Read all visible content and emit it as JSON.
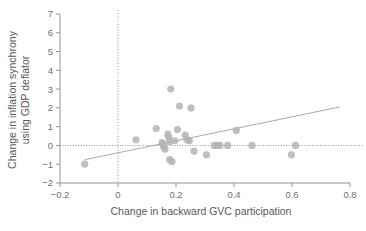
{
  "chart_data": {
    "type": "scatter",
    "title": "",
    "xlabel": "Change in backward GVC participation",
    "ylabel": "Change in inflation synchrony using GDP deflator",
    "ylabel_line1": "Change in inflation synchrony",
    "ylabel_line2": "using GDP deflator",
    "xlim": [
      -0.2,
      0.8
    ],
    "ylim": [
      -2,
      7
    ],
    "xticks": [
      -0.2,
      0,
      0.2,
      0.4,
      0.6,
      0.8
    ],
    "xticklabels": [
      "−0.2",
      "0",
      "0.2",
      "0.4",
      "0.6",
      "0.8"
    ],
    "yticks": [
      -2,
      -1,
      0,
      1,
      2,
      3,
      4,
      5,
      6,
      7
    ],
    "yticklabels": [
      "−2",
      "−1",
      "0",
      "1",
      "2",
      "3",
      "4",
      "5",
      "6",
      "7"
    ],
    "grid": false,
    "legend": "none",
    "reference_lines": [
      {
        "name": "y-zero",
        "orientation": "horizontal",
        "value": 0,
        "style": "dotted"
      },
      {
        "name": "x-zero",
        "orientation": "vertical",
        "value": 0,
        "style": "dotted"
      }
    ],
    "trendline": {
      "name": "linear-fit",
      "x_start": -0.115,
      "y_start": -0.76,
      "x_end": 0.765,
      "y_end": 2.05
    },
    "marker": {
      "shape": "circle",
      "color": "#b2b4b6",
      "radius_px": 3.6
    },
    "points": [
      {
        "x": -0.115,
        "y": -1.0
      },
      {
        "x": 0.062,
        "y": 0.3
      },
      {
        "x": 0.132,
        "y": 0.9
      },
      {
        "x": 0.152,
        "y": 0.15
      },
      {
        "x": 0.155,
        "y": 0.05
      },
      {
        "x": 0.158,
        "y": -0.1
      },
      {
        "x": 0.162,
        "y": -0.2
      },
      {
        "x": 0.172,
        "y": 0.6
      },
      {
        "x": 0.175,
        "y": 0.45
      },
      {
        "x": 0.178,
        "y": 0.2
      },
      {
        "x": 0.182,
        "y": 3.0
      },
      {
        "x": 0.178,
        "y": -0.75
      },
      {
        "x": 0.186,
        "y": -0.85
      },
      {
        "x": 0.196,
        "y": 0.25
      },
      {
        "x": 0.205,
        "y": 0.85
      },
      {
        "x": 0.212,
        "y": 2.1
      },
      {
        "x": 0.232,
        "y": 0.55
      },
      {
        "x": 0.238,
        "y": 0.3
      },
      {
        "x": 0.246,
        "y": 0.25
      },
      {
        "x": 0.252,
        "y": 2.0
      },
      {
        "x": 0.262,
        "y": -0.3
      },
      {
        "x": 0.305,
        "y": -0.5
      },
      {
        "x": 0.332,
        "y": 0.0
      },
      {
        "x": 0.342,
        "y": 0.0
      },
      {
        "x": 0.352,
        "y": 0.0
      },
      {
        "x": 0.378,
        "y": 0.0
      },
      {
        "x": 0.408,
        "y": 0.8
      },
      {
        "x": 0.462,
        "y": 0.0
      },
      {
        "x": 0.598,
        "y": -0.5
      },
      {
        "x": 0.612,
        "y": 0.0
      }
    ]
  }
}
